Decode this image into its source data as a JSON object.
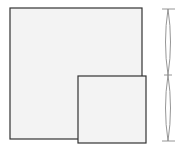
{
  "diagram": {
    "colors": {
      "background": "#ffffff",
      "square_fill": "#f3f3f3",
      "square_stroke": "#333333",
      "bracket_stroke": "#8a8a8a"
    },
    "large_square": {
      "x": 10,
      "y": 8,
      "width": 132,
      "height": 131
    },
    "small_square": {
      "x": 78,
      "y": 76,
      "width": 68,
      "height": 67
    },
    "bracket": {
      "center_x": 168,
      "ticks_y": [
        9,
        75,
        141
      ],
      "tick_half_width": 6,
      "bulge": 3
    }
  }
}
